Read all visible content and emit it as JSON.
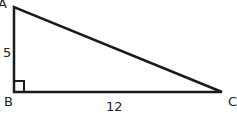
{
  "diagram": {
    "type": "right-triangle",
    "vertices": {
      "A": "A",
      "B": "B",
      "C": "C"
    },
    "sides": {
      "AB": "5",
      "BC": "12"
    },
    "right_angle_at": "B",
    "stroke_color": "#1a1a1a"
  }
}
